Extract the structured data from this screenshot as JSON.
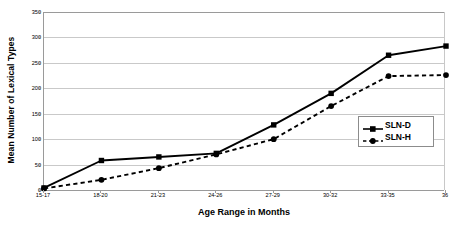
{
  "chart_data": {
    "type": "line",
    "title": "",
    "xlabel": "Age Range in Months",
    "ylabel": "Mean Number of Lexical Types",
    "categories": [
      "15-17",
      "18-20",
      "21-23",
      "24-26",
      "27-29",
      "30-32",
      "33-35",
      "36"
    ],
    "ylim": [
      0,
      350
    ],
    "yticks": [
      0,
      50,
      100,
      150,
      200,
      250,
      300,
      350
    ],
    "ytick_labels": [
      "0",
      "50",
      "100",
      "150",
      "200",
      "250",
      "300",
      "350"
    ],
    "grid": true,
    "legend_position": "right-inside",
    "series": [
      {
        "name": "SLN-D",
        "values": [
          4,
          58,
          65,
          72,
          128,
          190,
          265,
          283
        ],
        "line_style": "solid",
        "marker": "square",
        "color": "#000000"
      },
      {
        "name": "SLN-H",
        "values": [
          3,
          20,
          43,
          70,
          100,
          165,
          224,
          226
        ],
        "line_style": "dashed",
        "marker": "circle",
        "color": "#000000"
      }
    ]
  },
  "legend": {
    "items": [
      {
        "label": "SLN-D"
      },
      {
        "label": "SLN-H"
      }
    ]
  },
  "colors": {
    "series": "#000000",
    "gridline": "#c9c9c9",
    "axis": "#9a9a9a",
    "background": "#ffffff"
  }
}
